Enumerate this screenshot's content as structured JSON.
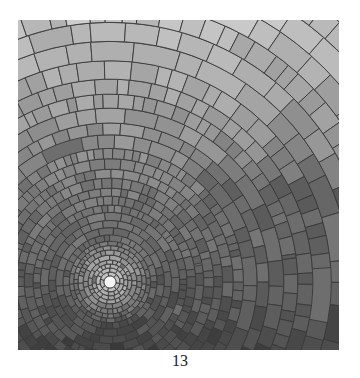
{
  "page": {
    "figure": {
      "description": "Grayscale mosaic of tiles arranged in concentric arcs around a bright central point",
      "colors": {
        "center_glow": "#f4f4f4",
        "top_tone": "#b8b8b8",
        "bottom_tone": "#4a4a4a",
        "grout": "#3a3a3a"
      }
    },
    "page_number": "13"
  }
}
